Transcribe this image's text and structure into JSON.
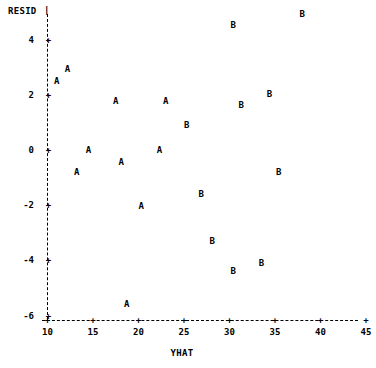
{
  "chart_data": {
    "type": "scatter",
    "title": "",
    "xlabel": "YHAT",
    "ylabel": "RESID",
    "xlim": [
      10,
      45
    ],
    "ylim": [
      -6,
      5
    ],
    "grid": false,
    "legend": "none",
    "xticks": [
      10,
      15,
      20,
      25,
      30,
      35,
      40,
      45
    ],
    "xtick_labels": [
      "10",
      "15",
      "20",
      "25",
      "30",
      "35",
      "40",
      "45"
    ],
    "yticks": [
      4,
      2,
      0,
      -2,
      -4,
      -6
    ],
    "ytick_labels": [
      "4",
      "2",
      "0",
      "-2",
      "-4",
      "-6"
    ],
    "point_markers": [
      "A",
      "B"
    ],
    "series": [
      {
        "name": "A",
        "marker": "A",
        "points": [
          {
            "x": 12.2,
            "y": 2.9
          },
          {
            "x": 11.0,
            "y": 2.5
          },
          {
            "x": 17.5,
            "y": 1.75
          },
          {
            "x": 23.0,
            "y": 1.75
          },
          {
            "x": 14.5,
            "y": 0.0
          },
          {
            "x": 22.3,
            "y": 0.0
          },
          {
            "x": 18.1,
            "y": -0.45
          },
          {
            "x": 13.2,
            "y": -0.8
          },
          {
            "x": 20.3,
            "y": -2.05
          },
          {
            "x": 18.7,
            "y": -5.6
          }
        ]
      },
      {
        "name": "B",
        "marker": "B",
        "points": [
          {
            "x": 38.0,
            "y": 4.9
          },
          {
            "x": 30.4,
            "y": 4.5
          },
          {
            "x": 34.4,
            "y": 2.0
          },
          {
            "x": 31.3,
            "y": 1.6
          },
          {
            "x": 25.3,
            "y": 0.9
          },
          {
            "x": 35.4,
            "y": -0.8
          },
          {
            "x": 26.9,
            "y": -1.6
          },
          {
            "x": 28.1,
            "y": -3.3
          },
          {
            "x": 33.5,
            "y": -4.1
          },
          {
            "x": 30.4,
            "y": -4.4
          }
        ]
      }
    ]
  },
  "axes": {
    "y_axis_title": "RESID",
    "x_axis_title": "YHAT",
    "tick_glyph": "+",
    "pipe_glyph": "|"
  },
  "colors": {
    "background": "#ffffff",
    "foreground": "#000000"
  }
}
